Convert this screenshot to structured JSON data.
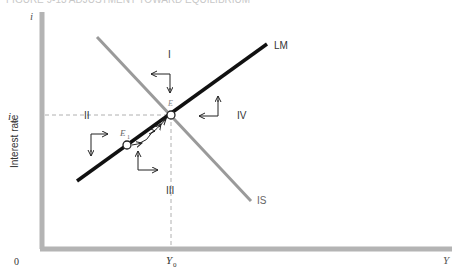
{
  "caption": "FIGURE 9-13 ADJUSTMENT TOWARD EQUILIBRIUM",
  "axes": {
    "y_symbol": "i",
    "y_label": "Interest rate",
    "x_symbol": "Y",
    "origin": "0",
    "i0_label": "i",
    "i0_sub": "0",
    "y0_label": "Y",
    "y0_sub": "0"
  },
  "curves": {
    "lm_label": "LM",
    "is_label": "IS"
  },
  "points": {
    "e_label": "E",
    "e1_label": "E",
    "e1_sub": "1"
  },
  "regions": {
    "r1": "I",
    "r2": "II",
    "r3": "III",
    "r4": "IV"
  },
  "colors": {
    "axis": "#b4b4b4",
    "lm": "#111111",
    "is": "#9a9a9a",
    "dashed": "#b0b0b0"
  }
}
